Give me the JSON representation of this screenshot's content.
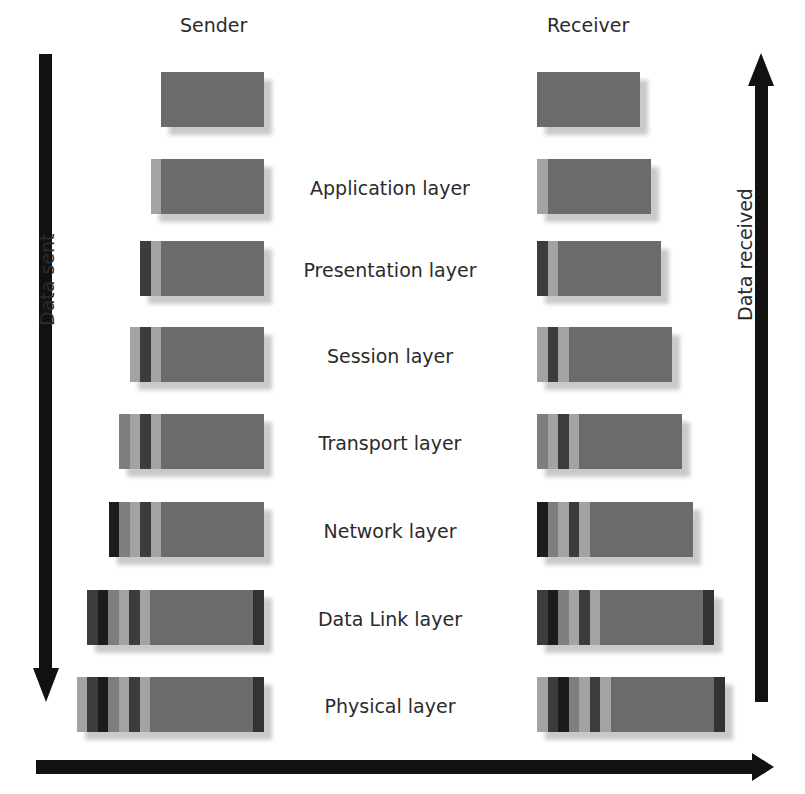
{
  "titles": {
    "sender": "Sender",
    "receiver": "Receiver"
  },
  "axis_labels": {
    "sent": "Data sent",
    "received": "Data received"
  },
  "colors": {
    "payload": "#6b6b6b",
    "L": "#a3a3a3",
    "D": "#3c3c3c",
    "K": "#1c1c1c",
    "M": "#7e7e7e",
    "T": "#333333",
    "arrow": "#111111"
  },
  "layers": [
    {
      "label": "",
      "y": 72,
      "prefix": [],
      "trailer": false
    },
    {
      "label": "Application layer",
      "y": 159,
      "prefix": [
        "L"
      ],
      "trailer": false
    },
    {
      "label": "Presentation layer",
      "y": 241,
      "prefix": [
        "D",
        "L"
      ],
      "trailer": false
    },
    {
      "label": "Session layer",
      "y": 327,
      "prefix": [
        "L",
        "D",
        "L"
      ],
      "trailer": false
    },
    {
      "label": "Transport layer",
      "y": 414,
      "prefix": [
        "M",
        "L",
        "D",
        "L"
      ],
      "trailer": false
    },
    {
      "label": "Network layer",
      "y": 502,
      "prefix": [
        "K",
        "M",
        "L",
        "D",
        "L"
      ],
      "trailer": false
    },
    {
      "label": "Data Link layer",
      "y": 590,
      "prefix": [
        "D",
        "K",
        "M",
        "L",
        "D",
        "L"
      ],
      "trailer": true
    },
    {
      "label": "Physical layer",
      "y": 677,
      "prefix": [
        "L",
        "D",
        "K",
        "M",
        "L",
        "D",
        "L"
      ],
      "trailer": true
    }
  ]
}
